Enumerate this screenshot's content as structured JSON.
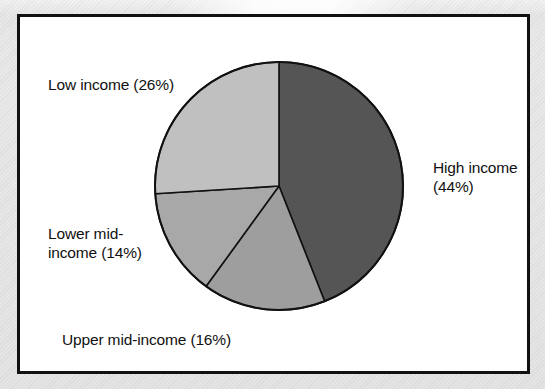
{
  "chart_data": {
    "type": "pie",
    "title": "",
    "subtitle": "",
    "xlabel": "",
    "ylabel": "",
    "legend_position": "none",
    "grid": false,
    "start_angle_deg": 0,
    "direction": "clockwise",
    "categories": [
      "High income",
      "Upper mid-income",
      "Lower mid-income",
      "Low income"
    ],
    "values": [
      44,
      16,
      14,
      26
    ],
    "unit": "%",
    "slices": [
      {
        "name": "High income",
        "value": 44,
        "label": "High income\n(44%)",
        "color": "#555555",
        "start_deg": 0,
        "end_deg": 158.4
      },
      {
        "name": "Upper mid-income",
        "value": 16,
        "label": "Upper mid-income (16%)",
        "color": "#9e9e9e",
        "start_deg": 158.4,
        "end_deg": 216.0
      },
      {
        "name": "Lower mid-income",
        "value": 14,
        "label": "Lower mid-\nincome (14%)",
        "color": "#a8a8a8",
        "start_deg": 216.0,
        "end_deg": 266.4
      },
      {
        "name": "Low income",
        "value": 26,
        "label": "Low income (26%)",
        "color": "#c0c0c0",
        "start_deg": 266.4,
        "end_deg": 360.0
      }
    ]
  },
  "frame": {
    "border_color": "#111111",
    "background_color": "#ffffff"
  },
  "pie": {
    "center_x": 259,
    "center_y": 169,
    "radius": 124,
    "outline_color": "#111111"
  },
  "labels": {
    "low_income": "Low income (26%)",
    "high_income": "High income\n(44%)",
    "lower_mid_income": "Lower mid-\nincome (14%)",
    "upper_mid_income": "Upper mid-income (16%)"
  }
}
